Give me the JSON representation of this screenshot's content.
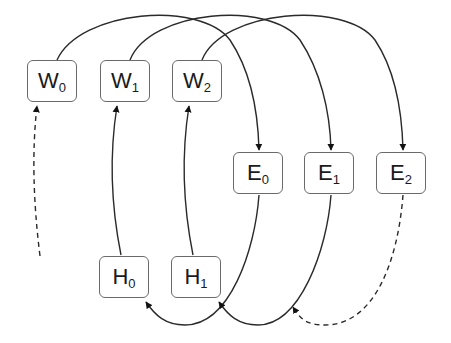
{
  "diagram": {
    "type": "data-flow",
    "nodes": {
      "W0": {
        "label": "W",
        "sub": "0"
      },
      "W1": {
        "label": "W",
        "sub": "1"
      },
      "W2": {
        "label": "W",
        "sub": "2"
      },
      "E0": {
        "label": "E",
        "sub": "0"
      },
      "E1": {
        "label": "E",
        "sub": "1"
      },
      "E2": {
        "label": "E",
        "sub": "2"
      },
      "H0": {
        "label": "H",
        "sub": "0"
      },
      "H1": {
        "label": "H",
        "sub": "1"
      }
    },
    "edges": [
      {
        "from": "W0",
        "to": "E0",
        "style": "solid"
      },
      {
        "from": "W1",
        "to": "E1",
        "style": "solid"
      },
      {
        "from": "W2",
        "to": "E2",
        "style": "solid"
      },
      {
        "from": "E0",
        "to": "H0",
        "style": "solid"
      },
      {
        "from": "E1",
        "to": "H1",
        "style": "solid"
      },
      {
        "from": "E2",
        "to": "E1-H1 path",
        "style": "dashed"
      },
      {
        "from": "H0",
        "to": "W1",
        "style": "solid"
      },
      {
        "from": "H1",
        "to": "W2",
        "style": "solid"
      },
      {
        "from": "off-canvas",
        "to": "W0",
        "style": "dashed"
      }
    ],
    "colors": {
      "line": "#2a2a2a",
      "box_border": "#6a6a6a",
      "text": "#1a1a1a"
    }
  }
}
